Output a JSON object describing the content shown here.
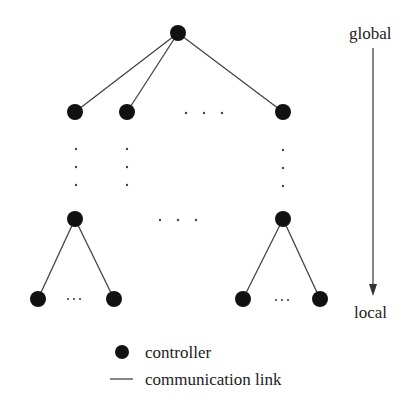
{
  "diagram": {
    "scale_top_label": "global",
    "scale_bottom_label": "local",
    "horizontal_ellipsis": "· · ·",
    "leaf_ellipsis": "···"
  },
  "legend": {
    "controller_label": "controller",
    "link_label": "communication link"
  },
  "colors": {
    "node": "#111111",
    "link": "#444444",
    "background": "#ffffff"
  }
}
